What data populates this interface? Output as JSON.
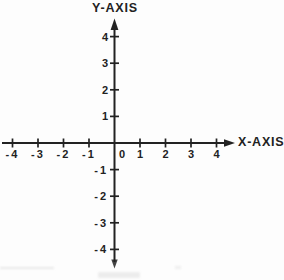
{
  "figure": {
    "background": "#fdfdfd",
    "ink_color": "#222222"
  },
  "chart_data": {
    "type": "scatter",
    "title": "",
    "xlabel": "X-AXIS",
    "ylabel": "Y-AXIS",
    "x_ticks": [
      -4,
      -3,
      -2,
      -1,
      0,
      1,
      2,
      3,
      4
    ],
    "x_tick_labels": [
      "-4",
      "-3",
      "-2",
      "-1",
      "0",
      "1",
      "2",
      "3",
      "4"
    ],
    "y_ticks": [
      -4,
      -3,
      -2,
      -1,
      1,
      2,
      3,
      4
    ],
    "y_tick_labels": [
      "-4",
      "-3",
      "-2",
      "-1",
      "1",
      "2",
      "3",
      "4"
    ],
    "origin_label": "0",
    "xlim": [
      -4.5,
      4.7
    ],
    "ylim": [
      -4.8,
      4.7
    ],
    "grid": false,
    "legend": false,
    "series": []
  }
}
